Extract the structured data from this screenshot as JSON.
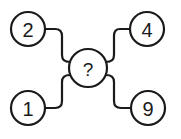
{
  "diagram": {
    "type": "number-puzzle",
    "center": {
      "label": "?",
      "cx": 88,
      "cy": 68,
      "r": 19
    },
    "nodes": [
      {
        "id": "top-left",
        "label": "2",
        "cx": 28,
        "cy": 29,
        "r": 17
      },
      {
        "id": "top-right",
        "label": "4",
        "cx": 147,
        "cy": 29,
        "r": 17
      },
      {
        "id": "bottom-left",
        "label": "1",
        "cx": 28,
        "cy": 108,
        "r": 17
      },
      {
        "id": "bottom-right",
        "label": "9",
        "cx": 148,
        "cy": 108,
        "r": 17
      }
    ],
    "colors": {
      "stroke": "#1a1a1a",
      "fill": "#ffffff"
    }
  }
}
